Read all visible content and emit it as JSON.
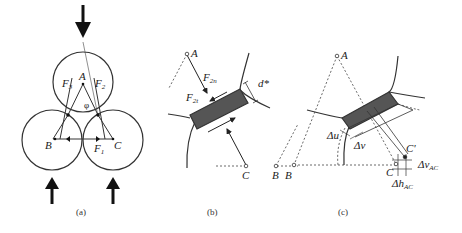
{
  "figure": {
    "panels": [
      {
        "id": "a",
        "caption": "(a)",
        "labels": {
          "A": "A",
          "B": "B",
          "C": "C",
          "F1": "F",
          "F1_sub": "1",
          "F2": "F",
          "F2_sub": "2",
          "F3": "F",
          "F3_sub": "3",
          "phi": "φ"
        },
        "elements": [
          "three contacting circles",
          "downward load arrow at top",
          "two upward load arrows at bottom",
          "force triangle A-B-C"
        ]
      },
      {
        "id": "b",
        "caption": "(b)",
        "labels": {
          "A": "A",
          "C": "C",
          "B": "B",
          "F2n": "F",
          "F2n_sub": "2n",
          "F2t": "F",
          "F2t_sub": "2t",
          "d": "d*"
        },
        "elements": [
          "bond element between grains (shaded)",
          "normal and tangential forces"
        ]
      },
      {
        "id": "c",
        "caption": "(c)",
        "labels": {
          "A": "A",
          "B": "B",
          "C": "C",
          "C_prime": "C'",
          "du": "Δu",
          "dv": "Δv",
          "dv_ac": "Δv",
          "dv_ac_sub": "AC",
          "dh_ac": "Δh",
          "dh_ac_sub": "AC"
        },
        "elements": [
          "deformed bond",
          "displacement of C to C'"
        ]
      }
    ],
    "colors": {
      "line": "#333333",
      "bond_fill": "#555555",
      "dash": "#444444"
    }
  }
}
